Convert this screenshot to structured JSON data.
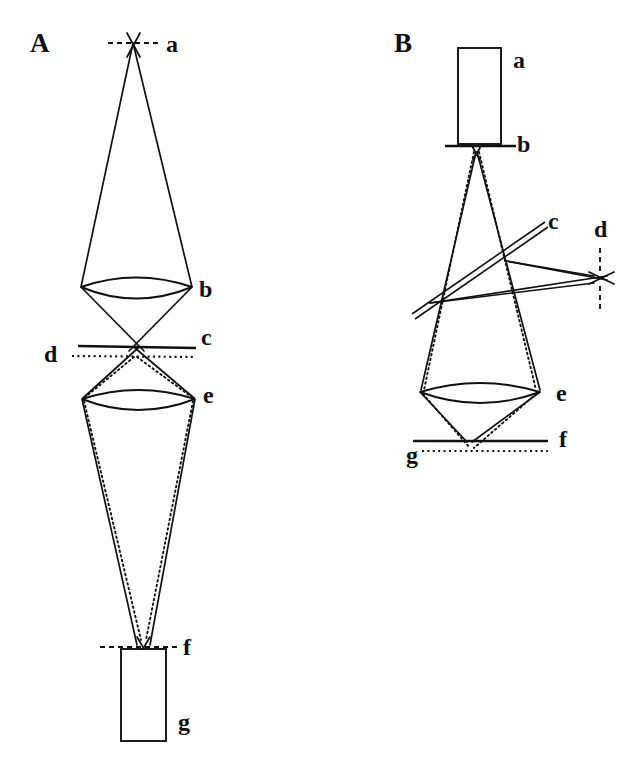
{
  "figure": {
    "background_color": "#ffffff",
    "ink_color": "#111111",
    "width": 638,
    "height": 775
  },
  "panels": [
    {
      "id": "A",
      "letter": "A",
      "letter_x": 30,
      "letter_y": 52,
      "description": "Upright ray path: point source at top, condenser lens, specimen planes, objective lens, image point, detector block at bottom",
      "labels": [
        {
          "key": "a",
          "text": "a",
          "x": 166,
          "y": 52,
          "role": "point-source"
        },
        {
          "key": "b",
          "text": "b",
          "x": 199,
          "y": 297,
          "role": "lens"
        },
        {
          "key": "c",
          "text": "c",
          "x": 201,
          "y": 345,
          "role": "solid-plane"
        },
        {
          "key": "d",
          "text": "d",
          "x": 44,
          "y": 362,
          "role": "dotted-plane"
        },
        {
          "key": "e",
          "text": "e",
          "x": 203,
          "y": 403,
          "role": "lens"
        },
        {
          "key": "f",
          "text": "f",
          "x": 183,
          "y": 643,
          "role": "image-plane"
        },
        {
          "key": "g",
          "text": "g",
          "x": 178,
          "y": 723,
          "role": "detector-block"
        }
      ]
    },
    {
      "id": "B",
      "letter": "B",
      "letter_x": 394,
      "letter_y": 52,
      "description": "Inverted ray path: source block at top, aperture plane, crossed beam splitter and off-axis conjugate point, objective lens, image planes at bottom",
      "labels": [
        {
          "key": "a",
          "text": "a",
          "x": 513,
          "y": 68,
          "role": "source-block"
        },
        {
          "key": "b",
          "text": "b",
          "x": 517,
          "y": 150,
          "role": "aperture-plane"
        },
        {
          "key": "c",
          "text": "c",
          "x": 552,
          "y": 230,
          "role": "beam-splitter"
        },
        {
          "key": "d",
          "text": "d",
          "x": 601,
          "y": 232,
          "role": "conjugate-point"
        },
        {
          "key": "e",
          "text": "e",
          "x": 556,
          "y": 401,
          "role": "lens"
        },
        {
          "key": "f",
          "text": "f",
          "x": 559,
          "y": 440,
          "role": "solid-plane"
        },
        {
          "key": "g",
          "text": "g",
          "x": 411,
          "y": 460,
          "role": "dotted-plane"
        }
      ]
    }
  ],
  "footer": {
    "ghost_caption": ""
  }
}
